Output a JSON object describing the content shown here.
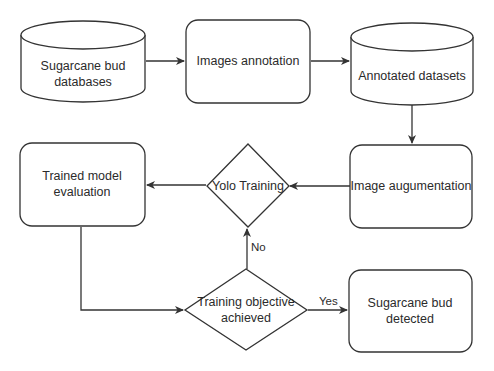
{
  "diagram": {
    "type": "flowchart",
    "stroke_color": "#333333",
    "fill_color": "#ffffff",
    "nodes": {
      "db": {
        "shape": "cylinder",
        "lines": [
          "Sugarcane bud",
          "databases"
        ]
      },
      "annot": {
        "shape": "rounded-rect",
        "lines": [
          "Images annotation"
        ]
      },
      "annotated": {
        "shape": "cylinder",
        "lines": [
          "Annotated datasets"
        ]
      },
      "augment": {
        "shape": "rounded-rect",
        "lines": [
          "Image augumentation"
        ]
      },
      "yolo": {
        "shape": "diamond",
        "lines": [
          "Yolo Training"
        ]
      },
      "eval": {
        "shape": "rounded-rect",
        "lines": [
          "Trained model",
          "evaluation"
        ]
      },
      "objective": {
        "shape": "diamond",
        "lines": [
          "Training objective",
          "achieved"
        ]
      },
      "detected": {
        "shape": "rounded-rect",
        "lines": [
          "Sugarcane bud",
          "detected"
        ]
      }
    },
    "edges": [
      {
        "from": "db",
        "to": "annot",
        "label": ""
      },
      {
        "from": "annot",
        "to": "annotated",
        "label": ""
      },
      {
        "from": "annotated",
        "to": "augment",
        "label": ""
      },
      {
        "from": "augment",
        "to": "yolo",
        "label": ""
      },
      {
        "from": "yolo",
        "to": "eval",
        "label": ""
      },
      {
        "from": "eval",
        "to": "objective",
        "label": ""
      },
      {
        "from": "objective",
        "to": "yolo",
        "label": "No"
      },
      {
        "from": "objective",
        "to": "detected",
        "label": "Yes"
      }
    ]
  }
}
